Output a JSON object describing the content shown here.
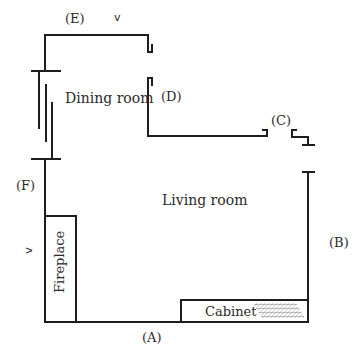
{
  "diagram": {
    "type": "floor-plan",
    "rooms": [
      {
        "id": "dining",
        "label": "Dining room"
      },
      {
        "id": "living",
        "label": "Living room"
      }
    ],
    "fixtures": [
      {
        "id": "fireplace",
        "label": "Fireplace"
      },
      {
        "id": "cabinet",
        "label": "Cabinet"
      }
    ],
    "markers": {
      "A": "(A)",
      "B": "(B)",
      "C": "(C)",
      "D": "(D)",
      "E": "(E)",
      "F": "(F)"
    },
    "arrows": {
      "top": "v",
      "left": "v"
    },
    "colors": {
      "line": "#1e1e1e",
      "text": "#2a2a2a",
      "hatch": "#555555",
      "background": "#ffffff"
    }
  }
}
